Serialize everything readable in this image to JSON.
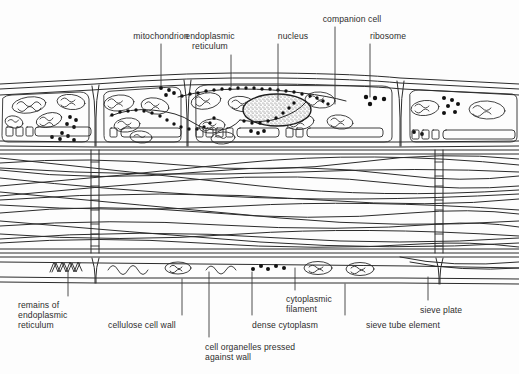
{
  "figure": {
    "kind": "phloem-tissue-cross-section-diagram",
    "background_color": "#fdfdfd",
    "ink_color": "#2b2b2b",
    "text_color": "#2d2d2d"
  },
  "labels_top": [
    {
      "id": "mitochondrion",
      "text": "mitochondrion",
      "x": 161,
      "y": 31,
      "align": "ctr",
      "leader_x": 161,
      "leader_y1": 44,
      "leader_y2": 86
    },
    {
      "id": "endoplasmic-reticulum",
      "text": "endoplasmic\nreticulum",
      "x": 210,
      "y": 31,
      "align": "ctr",
      "leader_x": 231,
      "leader_y1": 55,
      "leader_y2": 87
    },
    {
      "id": "nucleus",
      "text": "nucleus",
      "x": 293,
      "y": 31,
      "align": "ctr",
      "leader_x": 278,
      "leader_y1": 44,
      "leader_y2": 100
    },
    {
      "id": "companion-cell",
      "text": "companion cell",
      "x": 352,
      "y": 14,
      "align": "ctr",
      "leader_x": 335,
      "leader_y1": 27,
      "leader_y2": 104
    },
    {
      "id": "ribosome",
      "text": "ribosome",
      "x": 388,
      "y": 31,
      "align": "ctr",
      "leader_x": 370,
      "leader_y1": 44,
      "leader_y2": 97
    }
  ],
  "labels_bottom": [
    {
      "id": "remains-of-endoplasmic-reticulum",
      "text": "remains of\nendoplasmic\nreticulum",
      "x": 18,
      "y": 300,
      "align": "lft",
      "leader_x": 68,
      "leader_y1": 272,
      "leader_y2": 296
    },
    {
      "id": "cellulose-cell-wall",
      "text": "cellulose cell wall",
      "x": 108,
      "y": 320,
      "align": "lft",
      "leader_x": 182,
      "leader_y1": 279,
      "leader_y2": 315
    },
    {
      "id": "cell-organelles-pressed-against-wall",
      "text": "cell organelles pressed\nagainst wall",
      "x": 205,
      "y": 342,
      "align": "lft",
      "leader_x": 209,
      "leader_y1": 272,
      "leader_y2": 337
    },
    {
      "id": "dense-cytoplasm",
      "text": "dense cytoplasm",
      "x": 252,
      "y": 320,
      "align": "lft",
      "leader_x": 252,
      "leader_y1": 272,
      "leader_y2": 315
    },
    {
      "id": "cytoplasmic-filament",
      "text": "cytoplasmic\nfilament",
      "x": 286,
      "y": 294,
      "align": "lft",
      "leader_x": 295,
      "leader_y1": 268,
      "leader_y2": 290
    },
    {
      "id": "sieve-tube-element",
      "text": "sieve tube element",
      "x": 366,
      "y": 320,
      "align": "lft",
      "leader_x": 345,
      "leader_y1": 284,
      "leader_y2": 315
    },
    {
      "id": "sieve-plate",
      "text": "sieve plate",
      "x": 420,
      "y": 305,
      "align": "lft",
      "leader_x": 428,
      "leader_y1": 277,
      "leader_y2": 300
    }
  ],
  "diagram_geometry": {
    "top_row": {
      "y_top": 78,
      "y_bottom": 146,
      "wall_x": [
        0,
        95,
        187,
        400,
        519
      ]
    },
    "middle_lumen": {
      "y_top": 146,
      "y_bottom": 252
    },
    "bottom_row": {
      "y_top": 252,
      "y_bottom": 278,
      "wall_x": [
        0,
        95,
        400,
        519
      ]
    },
    "sieve_plate_x": [
      94,
      438
    ],
    "filament_count": 16,
    "pore_rows": 5
  }
}
